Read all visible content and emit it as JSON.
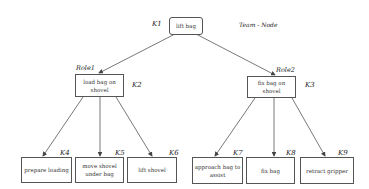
{
  "diagram": {
    "team_label": "Team - Node",
    "nodes": {
      "root": {
        "id": "K1",
        "text": "lift bag"
      },
      "k2": {
        "id": "K2",
        "text": "load bag on shovel",
        "role": "Role1"
      },
      "k3": {
        "id": "K3",
        "text": "fix bag on shovel",
        "role": "Role2"
      },
      "k4": {
        "id": "K4",
        "text": "prepare loading"
      },
      "k5": {
        "id": "K5",
        "text": "move shovel under bag"
      },
      "k6": {
        "id": "K6",
        "text": "lift shovel"
      },
      "k7": {
        "id": "K7",
        "text": "approach bag to assist"
      },
      "k8": {
        "id": "K8",
        "text": "fix bag"
      },
      "k9": {
        "id": "K9",
        "text": "retract gripper"
      }
    },
    "edges": [
      [
        "K1",
        "K2"
      ],
      [
        "K1",
        "K3"
      ],
      [
        "K2",
        "K4"
      ],
      [
        "K2",
        "K5"
      ],
      [
        "K2",
        "K6"
      ],
      [
        "K3",
        "K7"
      ],
      [
        "K3",
        "K8"
      ],
      [
        "K3",
        "K9"
      ]
    ]
  }
}
